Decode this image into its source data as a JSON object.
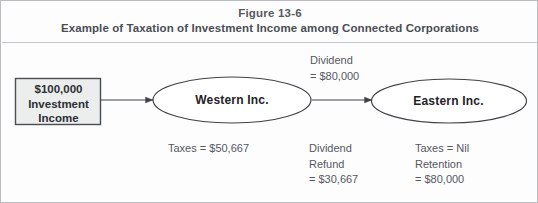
{
  "figure": {
    "number": "Figure 13-6",
    "subtitle": "Example of Taxation of Investment Income among Connected Corporations"
  },
  "diagram": {
    "source_box": {
      "line1": "$100,000",
      "line2": "Investment",
      "line3": "Income",
      "fill_color": "#eceded",
      "border_color": "#4a4d52"
    },
    "nodes": [
      {
        "id": "western",
        "label": "Western Inc."
      },
      {
        "id": "eastern",
        "label": "Eastern Inc."
      }
    ],
    "edges": [
      {
        "id": "income-to-western",
        "label": ""
      },
      {
        "id": "western-to-eastern",
        "label_line1": "Dividend",
        "label_line2": "= $80,000"
      }
    ],
    "annotations": {
      "dividend_top": "Dividend\n= $80,000",
      "taxes_western": "Taxes = $50,667",
      "dividend_refund": "Dividend\nRefund\n= $30,667",
      "taxes_eastern": "Taxes = Nil\nRetention\n= $80,000"
    }
  },
  "colors": {
    "border": "#b9bcc0",
    "text": "#55585e",
    "stroke": "#3f4247"
  }
}
